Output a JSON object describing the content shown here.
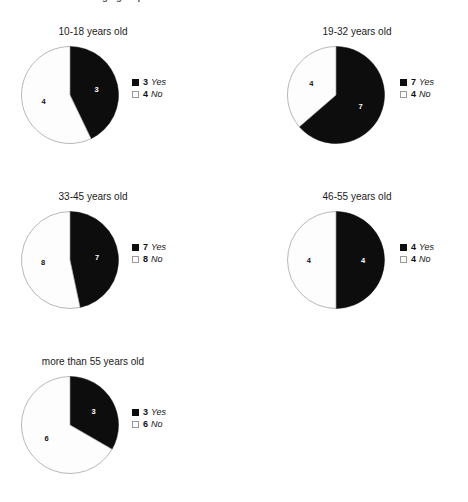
{
  "header": {
    "title": "Results within age groups"
  },
  "legend_labels": {
    "yes": "Yes",
    "no": "No"
  },
  "colors": {
    "yes_fill": "#0d0d0d",
    "no_fill": "#fdfdfd",
    "no_stroke": "#9a9a9a",
    "background": "#ffffff",
    "text": "#1a1a1a"
  },
  "chart_data": [
    {
      "type": "pie",
      "title": "10-18 years old",
      "categories": [
        "Yes",
        "No"
      ],
      "values": [
        3,
        4
      ],
      "total": 7,
      "legend": [
        {
          "count": "3",
          "label": "Yes",
          "swatch": "yes"
        },
        {
          "count": "4",
          "label": "No",
          "swatch": "no"
        }
      ],
      "slice_labels": [
        "3",
        "4"
      ]
    },
    {
      "type": "pie",
      "title": "19-32 years old",
      "categories": [
        "Yes",
        "No"
      ],
      "values": [
        7,
        4
      ],
      "total": 11,
      "legend": [
        {
          "count": "7",
          "label": "Yes",
          "swatch": "yes"
        },
        {
          "count": "4",
          "label": "No",
          "swatch": "no"
        }
      ],
      "slice_labels": [
        "7",
        "4"
      ]
    },
    {
      "type": "pie",
      "title": "33-45 years old",
      "categories": [
        "Yes",
        "No"
      ],
      "values": [
        7,
        8
      ],
      "total": 15,
      "legend": [
        {
          "count": "7",
          "label": "Yes",
          "swatch": "yes"
        },
        {
          "count": "8",
          "label": "No",
          "swatch": "no"
        }
      ],
      "slice_labels": [
        "7",
        "8"
      ]
    },
    {
      "type": "pie",
      "title": "46-55 years old",
      "categories": [
        "Yes",
        "No"
      ],
      "values": [
        4,
        4
      ],
      "total": 8,
      "legend": [
        {
          "count": "4",
          "label": "Yes",
          "swatch": "yes"
        },
        {
          "count": "4",
          "label": "No",
          "swatch": "no"
        }
      ],
      "slice_labels": [
        "4",
        "4"
      ]
    },
    {
      "type": "pie",
      "title": "more than 55 years old",
      "categories": [
        "Yes",
        "No"
      ],
      "values": [
        3,
        6
      ],
      "total": 9,
      "legend": [
        {
          "count": "3",
          "label": "Yes",
          "swatch": "yes"
        },
        {
          "count": "6",
          "label": "No",
          "swatch": "no"
        }
      ],
      "slice_labels": [
        "3",
        "6"
      ]
    }
  ]
}
